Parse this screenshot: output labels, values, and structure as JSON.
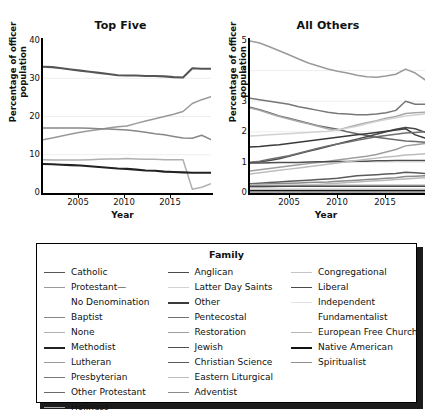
{
  "figure": {
    "panels": [
      {
        "title": "Top Five",
        "ylabel": "Percentage of officer population",
        "xlabel": "Year",
        "yticks": [
          "40",
          "30",
          "20",
          "10",
          "0"
        ],
        "xticks": [
          "2005",
          "2010",
          "2015"
        ]
      },
      {
        "title": "All Others",
        "ylabel": "Percentage of officer population",
        "xlabel": "Year",
        "yticks": [
          "5",
          "4",
          "3",
          "2",
          "1",
          "0"
        ],
        "xticks": [
          "2005",
          "2010",
          "2015"
        ]
      }
    ]
  },
  "legend": {
    "title": "Family",
    "columns": [
      {
        "items": [
          {
            "label": "Catholic",
            "color": "#555555",
            "width": 1.8
          },
          {
            "label": "Protestant—",
            "color": "#999999",
            "width": 1.4,
            "continuation": "No Denomination"
          },
          {
            "label": "Baptist",
            "color": "#888888",
            "width": 1.4
          },
          {
            "label": "None",
            "color": "#b0b0b0",
            "width": 1.4
          },
          {
            "label": "Methodist",
            "color": "#222222",
            "width": 2.2
          },
          {
            "label": "Lutheran",
            "color": "#9a9a9a",
            "width": 1.4
          },
          {
            "label": "Presbyterian",
            "color": "#777777",
            "width": 1.6
          },
          {
            "label": "Other Protestant",
            "color": "#6a6a6a",
            "width": 1.6
          },
          {
            "label": "Holiness",
            "color": "#a8a8a8",
            "width": 1.4
          }
        ]
      },
      {
        "items": [
          {
            "label": "Anglican",
            "color": "#4a4a4a",
            "width": 1.9
          },
          {
            "label": "Latter Day Saints",
            "color": "#d2d2d2",
            "width": 1.4
          },
          {
            "label": "Other",
            "color": "#3a3a3a",
            "width": 2.0
          },
          {
            "label": "Pentecostal",
            "color": "#6f6f6f",
            "width": 1.6
          },
          {
            "label": "Restoration",
            "color": "#9e9e9e",
            "width": 1.4
          },
          {
            "label": "Jewish",
            "color": "#4f4f4f",
            "width": 1.9
          },
          {
            "label": "Christian Science",
            "color": "#5a5a5a",
            "width": 1.8
          },
          {
            "label": "Eastern Liturgical",
            "color": "#bdbdbd",
            "width": 1.4
          },
          {
            "label": "Adventist",
            "color": "#8a8a8a",
            "width": 1.5
          }
        ]
      },
      {
        "items": [
          {
            "label": "Congregational",
            "color": "#c4c4c4",
            "width": 1.4
          },
          {
            "label": "Liberal",
            "color": "#4a4a4a",
            "width": 1.9
          },
          {
            "label": "Independent",
            "color": "#e2e2e2",
            "width": 1.4,
            "continuation": "Fundamentalist"
          },
          {
            "label": "European Free Church",
            "color": "#b5b5b5",
            "width": 1.4
          },
          {
            "label": "Native American",
            "color": "#151515",
            "width": 2.4
          },
          {
            "label": "Spiritualist",
            "color": "#8f8f8f",
            "width": 1.5
          }
        ]
      }
    ]
  },
  "chart_data": [
    {
      "type": "line",
      "title": "Top Five",
      "xlabel": "Year",
      "ylabel": "Percentage of officer population",
      "xlim": [
        2001,
        2019
      ],
      "ylim": [
        0,
        40
      ],
      "yticks": [
        0,
        10,
        20,
        30,
        40
      ],
      "xticks": [
        2005,
        2010,
        2015
      ],
      "grid": true,
      "legend": "external",
      "x": [
        2001,
        2002,
        2003,
        2004,
        2005,
        2006,
        2007,
        2008,
        2009,
        2010,
        2011,
        2012,
        2013,
        2014,
        2015,
        2016,
        2017,
        2018,
        2019
      ],
      "series": [
        {
          "name": "Catholic",
          "color": "#555555",
          "values": [
            33.0,
            32.9,
            32.6,
            32.3,
            32.0,
            31.7,
            31.4,
            31.1,
            30.8,
            30.7,
            30.7,
            30.6,
            30.6,
            30.5,
            30.3,
            30.2,
            32.6,
            32.5,
            32.5
          ]
        },
        {
          "name": "Protestant—No Denomination",
          "color": "#999999",
          "values": [
            13.9,
            14.4,
            14.9,
            15.4,
            15.9,
            16.3,
            16.6,
            17.0,
            17.3,
            17.5,
            18.2,
            18.8,
            19.4,
            20.0,
            20.6,
            21.3,
            23.4,
            24.4,
            25.2
          ]
        },
        {
          "name": "Baptist",
          "color": "#888888",
          "values": [
            17.0,
            17.0,
            17.0,
            17.0,
            17.0,
            16.9,
            16.8,
            16.7,
            16.6,
            16.5,
            16.2,
            15.9,
            15.5,
            15.2,
            14.8,
            14.4,
            14.3,
            15.1,
            14.0
          ]
        },
        {
          "name": "None",
          "color": "#b0b0b0",
          "values": [
            8.7,
            8.6,
            8.6,
            8.6,
            8.6,
            8.7,
            8.8,
            8.9,
            8.9,
            9.0,
            8.9,
            8.8,
            8.8,
            8.7,
            8.7,
            8.7,
            1.0,
            1.5,
            2.4
          ]
        },
        {
          "name": "Methodist",
          "color": "#222222",
          "values": [
            7.6,
            7.5,
            7.4,
            7.3,
            7.2,
            7.0,
            6.8,
            6.6,
            6.4,
            6.3,
            6.1,
            5.9,
            5.8,
            5.6,
            5.5,
            5.4,
            5.3,
            5.3,
            5.3
          ]
        }
      ]
    },
    {
      "type": "line",
      "title": "All Others",
      "xlabel": "Year",
      "ylabel": "Percentage of officer population",
      "xlim": [
        2001,
        2019
      ],
      "ylim": [
        0,
        5
      ],
      "yticks": [
        0,
        1,
        2,
        3,
        4,
        5
      ],
      "xticks": [
        2005,
        2010,
        2015
      ],
      "grid": true,
      "legend": "external",
      "x": [
        2001,
        2002,
        2003,
        2004,
        2005,
        2006,
        2007,
        2008,
        2009,
        2010,
        2011,
        2012,
        2013,
        2014,
        2015,
        2016,
        2017,
        2018,
        2019
      ],
      "series": [
        {
          "name": "Lutheran",
          "color": "#9a9a9a",
          "values": [
            4.97,
            4.9,
            4.78,
            4.65,
            4.52,
            4.38,
            4.25,
            4.15,
            4.05,
            3.98,
            3.92,
            3.85,
            3.8,
            3.78,
            3.82,
            3.88,
            4.05,
            3.92,
            3.7
          ]
        },
        {
          "name": "Presbyterian",
          "color": "#777777",
          "values": [
            3.1,
            3.05,
            3.0,
            2.95,
            2.9,
            2.82,
            2.76,
            2.7,
            2.64,
            2.6,
            2.58,
            2.56,
            2.56,
            2.58,
            2.62,
            2.7,
            3.0,
            2.9,
            2.9
          ]
        },
        {
          "name": "Other Protestant",
          "color": "#6a6a6a",
          "values": [
            2.8,
            2.72,
            2.62,
            2.52,
            2.44,
            2.36,
            2.28,
            2.2,
            2.14,
            2.08,
            2.0,
            1.94,
            1.88,
            1.82,
            1.78,
            1.74,
            1.7,
            1.68,
            1.66
          ]
        },
        {
          "name": "Holiness",
          "color": "#a8a8a8",
          "values": [
            2.78,
            2.7,
            2.6,
            2.5,
            2.42,
            2.34,
            2.26,
            2.18,
            2.1,
            2.05,
            2.14,
            2.22,
            2.3,
            2.36,
            2.44,
            2.5,
            2.6,
            2.62,
            2.64
          ]
        },
        {
          "name": "Anglican",
          "color": "#4a4a4a",
          "values": [
            1.0,
            1.02,
            1.06,
            1.12,
            1.2,
            1.28,
            1.36,
            1.44,
            1.52,
            1.6,
            1.68,
            1.76,
            1.84,
            1.92,
            2.0,
            2.08,
            2.14,
            2.1,
            1.98
          ]
        },
        {
          "name": "Latter Day Saints",
          "color": "#d2d2d2",
          "values": [
            1.86,
            1.88,
            1.9,
            1.92,
            1.94,
            1.96,
            1.98,
            2.0,
            2.02,
            2.06,
            2.12,
            2.18,
            2.26,
            2.34,
            2.4,
            2.46,
            2.52,
            2.55,
            2.58
          ]
        },
        {
          "name": "Other",
          "color": "#3a3a3a",
          "values": [
            1.5,
            1.52,
            1.55,
            1.58,
            1.62,
            1.66,
            1.7,
            1.74,
            1.78,
            1.82,
            1.86,
            1.9,
            1.94,
            1.98,
            2.02,
            2.06,
            2.1,
            1.9,
            1.8
          ]
        },
        {
          "name": "Pentecostal",
          "color": "#6f6f6f",
          "values": [
            1.0,
            1.04,
            1.1,
            1.16,
            1.22,
            1.3,
            1.38,
            1.46,
            1.54,
            1.6,
            1.66,
            1.72,
            1.78,
            1.84,
            1.88,
            1.92,
            1.96,
            1.98,
            2.0
          ]
        },
        {
          "name": "Restoration",
          "color": "#9e9e9e",
          "values": [
            0.72,
            0.76,
            0.8,
            0.84,
            0.88,
            0.92,
            0.96,
            1.0,
            1.04,
            1.08,
            1.12,
            1.16,
            1.2,
            1.26,
            1.34,
            1.42,
            1.54,
            1.58,
            1.62
          ]
        },
        {
          "name": "Jewish",
          "color": "#4f4f4f",
          "values": [
            0.98,
            0.98,
            0.99,
            1.0,
            1.0,
            1.0,
            1.01,
            1.02,
            1.02,
            1.03,
            1.03,
            1.04,
            1.04,
            1.05,
            1.05,
            1.06,
            1.06,
            1.06,
            1.06
          ]
        },
        {
          "name": "Christian Science",
          "color": "#5a5a5a",
          "values": [
            0.3,
            0.32,
            0.34,
            0.36,
            0.38,
            0.4,
            0.42,
            0.44,
            0.46,
            0.48,
            0.52,
            0.56,
            0.58,
            0.6,
            0.62,
            0.64,
            0.68,
            0.66,
            0.64
          ]
        },
        {
          "name": "Eastern Liturgical",
          "color": "#bdbdbd",
          "values": [
            0.62,
            0.66,
            0.7,
            0.74,
            0.78,
            0.82,
            0.86,
            0.9,
            0.94,
            0.98,
            1.02,
            1.06,
            1.1,
            1.14,
            1.18,
            1.2,
            1.24,
            1.26,
            1.28
          ]
        },
        {
          "name": "Adventist",
          "color": "#8a8a8a",
          "values": [
            0.28,
            0.29,
            0.3,
            0.31,
            0.32,
            0.33,
            0.34,
            0.35,
            0.36,
            0.38,
            0.4,
            0.42,
            0.44,
            0.46,
            0.48,
            0.5,
            0.54,
            0.55,
            0.56
          ]
        },
        {
          "name": "Islam",
          "color": "#b8b8b8",
          "values": [
            0.18,
            0.19,
            0.2,
            0.21,
            0.22,
            0.24,
            0.26,
            0.28,
            0.3,
            0.32,
            0.34,
            0.36,
            0.38,
            0.4,
            0.42,
            0.44,
            0.46,
            0.48,
            0.5
          ]
        },
        {
          "name": "Congregational",
          "color": "#c4c4c4",
          "values": [
            0.26,
            0.26,
            0.26,
            0.26,
            0.26,
            0.26,
            0.26,
            0.26,
            0.26,
            0.26,
            0.26,
            0.26,
            0.26,
            0.26,
            0.26,
            0.26,
            0.26,
            0.26,
            0.26
          ]
        },
        {
          "name": "Liberal",
          "color": "#4a4a4a",
          "values": [
            0.22,
            0.22,
            0.22,
            0.22,
            0.22,
            0.22,
            0.22,
            0.22,
            0.22,
            0.22,
            0.22,
            0.22,
            0.22,
            0.22,
            0.22,
            0.22,
            0.22,
            0.22,
            0.22
          ]
        },
        {
          "name": "Independent Fundamentalist",
          "color": "#e2e2e2",
          "values": [
            0.14,
            0.14,
            0.14,
            0.14,
            0.14,
            0.14,
            0.14,
            0.14,
            0.14,
            0.14,
            0.14,
            0.14,
            0.14,
            0.14,
            0.14,
            0.14,
            0.14,
            0.14,
            0.14
          ]
        },
        {
          "name": "European Free Church",
          "color": "#b5b5b5",
          "values": [
            0.1,
            0.1,
            0.1,
            0.1,
            0.1,
            0.1,
            0.1,
            0.1,
            0.1,
            0.1,
            0.1,
            0.1,
            0.1,
            0.1,
            0.1,
            0.1,
            0.1,
            0.1,
            0.1
          ]
        },
        {
          "name": "Native American",
          "color": "#151515",
          "values": [
            0.06,
            0.06,
            0.06,
            0.06,
            0.06,
            0.06,
            0.06,
            0.06,
            0.06,
            0.06,
            0.06,
            0.06,
            0.06,
            0.06,
            0.06,
            0.06,
            0.06,
            0.06,
            0.06
          ]
        },
        {
          "name": "Spiritualist",
          "color": "#8f8f8f",
          "values": [
            0.04,
            0.04,
            0.04,
            0.04,
            0.04,
            0.04,
            0.04,
            0.04,
            0.04,
            0.04,
            0.04,
            0.04,
            0.04,
            0.04,
            0.04,
            0.04,
            0.04,
            0.04,
            0.04
          ]
        }
      ]
    }
  ]
}
